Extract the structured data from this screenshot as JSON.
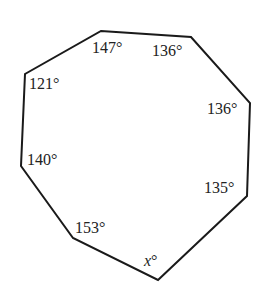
{
  "diagram": {
    "type": "polygon",
    "sides": 8,
    "stroke_color": "#1a1a1a",
    "angles": [
      {
        "id": "top-left",
        "label": "147°"
      },
      {
        "id": "top-right",
        "label": "136°"
      },
      {
        "id": "right-upper",
        "label": "136°"
      },
      {
        "id": "right-lower",
        "label": "135°"
      },
      {
        "id": "bottom",
        "label": "x°",
        "variable": "x",
        "unit": "°"
      },
      {
        "id": "bottom-left",
        "label": "153°"
      },
      {
        "id": "left-lower",
        "label": "140°"
      },
      {
        "id": "left-upper",
        "label": "121°"
      }
    ]
  }
}
